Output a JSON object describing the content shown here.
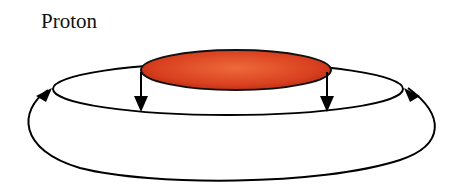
{
  "diagram": {
    "title": "Proton",
    "elements": [
      {
        "id": "proton-disk",
        "shape": "ellipse",
        "fill": "#d9401f"
      },
      {
        "id": "inner-loop",
        "shape": "ellipse",
        "stroke": "#000000"
      },
      {
        "id": "outer-loop",
        "shape": "curve",
        "stroke": "#000000"
      },
      {
        "id": "arrows",
        "count": 4,
        "directions": [
          "down",
          "down",
          "up-left",
          "up-right"
        ]
      }
    ],
    "colors": {
      "disk": "#d9401f",
      "disk_light": "#ea5a2e",
      "line": "#000000"
    }
  }
}
